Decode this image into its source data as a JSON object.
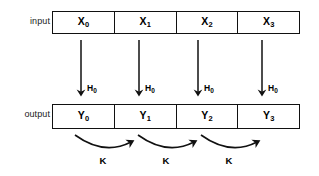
{
  "diagram": {
    "background_color": "#ffffff",
    "stroke_color": "#111111",
    "text_color": "#000000",
    "rows": {
      "input": {
        "label": "input",
        "cells": [
          {
            "base": "X",
            "sub": "0"
          },
          {
            "base": "X",
            "sub": "1"
          },
          {
            "base": "X",
            "sub": "2"
          },
          {
            "base": "X",
            "sub": "3"
          }
        ]
      },
      "output": {
        "label": "output",
        "cells": [
          {
            "base": "Y",
            "sub": "0"
          },
          {
            "base": "Y",
            "sub": "1"
          },
          {
            "base": "Y",
            "sub": "2"
          },
          {
            "base": "Y",
            "sub": "3"
          }
        ]
      }
    },
    "vertical_arrows": [
      {
        "label_base": "H",
        "label_sub": "0"
      },
      {
        "label_base": "H",
        "label_sub": "0"
      },
      {
        "label_base": "H",
        "label_sub": "0"
      },
      {
        "label_base": "H",
        "label_sub": "0"
      }
    ],
    "curved_arrows": [
      {
        "label": "K"
      },
      {
        "label": "K"
      },
      {
        "label": "K"
      }
    ]
  }
}
